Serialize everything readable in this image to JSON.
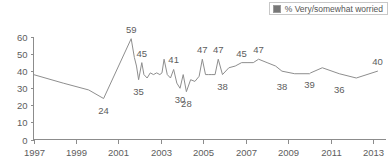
{
  "legend": {
    "entries": [
      {
        "label": "% Very/somewhat worried",
        "swatch": "legend-swatch-icon",
        "color": "#777777"
      }
    ],
    "position": "top-right"
  },
  "chart_data": {
    "type": "line",
    "title": "",
    "subtitle": "",
    "xlabel": "",
    "ylabel": "",
    "ylim": [
      0,
      60
    ],
    "xlim": [
      1997,
      2013.6
    ],
    "grid": false,
    "legend_position": "top-right",
    "ytick_labels": [
      "0",
      "10",
      "20",
      "30",
      "40",
      "50",
      "60"
    ],
    "ytick_values": [
      0,
      10,
      20,
      30,
      40,
      50,
      60
    ],
    "xtick_labels": [
      "1997",
      "1999",
      "2001",
      "2003",
      "2005",
      "2007",
      "2009",
      "2011",
      "2013"
    ],
    "xtick_values": [
      1997,
      1999,
      2001,
      2003,
      2005,
      2007,
      2009,
      2011,
      2013
    ],
    "series": [
      {
        "name": "% Very/somewhat worried",
        "color": "#8e8e8e",
        "x": [
          1997.0,
          1998.4,
          1999.6,
          2000.3,
          2001.6,
          2001.75,
          2001.85,
          2001.95,
          2002.1,
          2002.2,
          2002.35,
          2002.5,
          2002.65,
          2002.8,
          2002.95,
          2003.05,
          2003.15,
          2003.3,
          2003.45,
          2003.6,
          2003.75,
          2003.9,
          2004.05,
          2004.2,
          2004.4,
          2004.6,
          2004.8,
          2004.95,
          2005.1,
          2005.25,
          2005.4,
          2005.55,
          2005.7,
          2005.9,
          2006.2,
          2006.5,
          2006.8,
          2007.1,
          2007.35,
          2007.6,
          2008.0,
          2008.4,
          2008.7,
          2009.3,
          2010.0,
          2010.05,
          2010.6,
          2011.4,
          2012.2,
          2013.2
        ],
        "y": [
          38,
          33,
          29,
          24,
          59,
          48,
          43,
          35,
          45,
          38,
          36,
          39,
          38,
          39,
          38,
          39,
          47,
          38,
          36,
          41,
          33,
          30,
          38,
          28,
          35,
          34,
          37,
          47,
          38,
          38,
          38,
          38,
          47,
          38,
          42,
          43,
          45,
          45,
          45,
          47,
          45,
          43,
          40,
          38.5,
          38.5,
          39,
          42,
          38.5,
          36,
          40
        ]
      }
    ],
    "point_labels": [
      {
        "text": "24",
        "x": 2000.3,
        "y": 24,
        "placement": "below"
      },
      {
        "text": "59",
        "x": 2001.6,
        "y": 59,
        "placement": "above"
      },
      {
        "text": "45",
        "x": 2002.1,
        "y": 45,
        "placement": "above"
      },
      {
        "text": "35",
        "x": 2001.95,
        "y": 35,
        "placement": "below"
      },
      {
        "text": "41",
        "x": 2003.6,
        "y": 41,
        "placement": "above"
      },
      {
        "text": "30",
        "x": 2003.9,
        "y": 30,
        "placement": "below"
      },
      {
        "text": "28",
        "x": 2004.2,
        "y": 28,
        "placement": "below"
      },
      {
        "text": "47",
        "x": 2004.95,
        "y": 47,
        "placement": "above"
      },
      {
        "text": "47",
        "x": 2005.7,
        "y": 47,
        "placement": "above"
      },
      {
        "text": "38",
        "x": 2005.9,
        "y": 38,
        "placement": "below"
      },
      {
        "text": "45",
        "x": 2006.8,
        "y": 45,
        "placement": "above"
      },
      {
        "text": "47",
        "x": 2007.6,
        "y": 47,
        "placement": "above"
      },
      {
        "text": "38",
        "x": 2008.7,
        "y": 38,
        "placement": "below"
      },
      {
        "text": "39",
        "x": 2010.0,
        "y": 39,
        "placement": "below"
      },
      {
        "text": "36",
        "x": 2011.4,
        "y": 36,
        "placement": "below"
      },
      {
        "text": "40",
        "x": 2013.2,
        "y": 40,
        "placement": "above"
      }
    ]
  }
}
